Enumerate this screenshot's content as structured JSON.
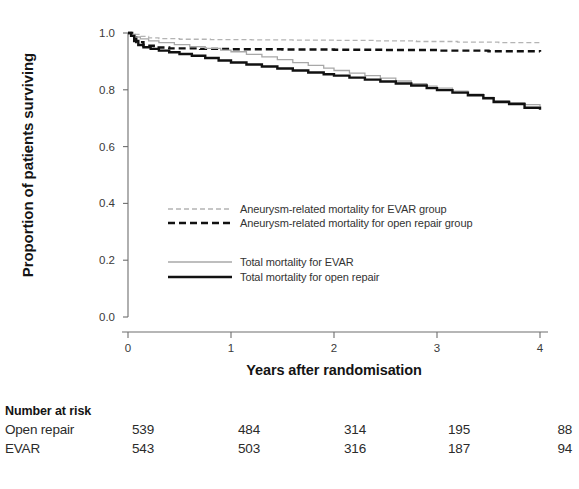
{
  "chart_data": {
    "type": "line",
    "title": "",
    "xlabel": "Years after randomisation",
    "ylabel": "Proportion of patients surviving",
    "xlim": [
      0,
      4
    ],
    "ylim": [
      0.0,
      1.0
    ],
    "xticks": [
      "0",
      "1",
      "2",
      "3",
      "4"
    ],
    "yticks": [
      "0.0",
      "0.2",
      "0.4",
      "0.6",
      "0.8",
      "1.0"
    ],
    "grid": false,
    "legend_position": "center-left",
    "series": [
      {
        "name": "Aneurysm-related mortality for EVAR group",
        "style": "dashed-thin",
        "color": "#b4b4b4",
        "x": [
          0,
          0.05,
          0.12,
          0.2,
          0.3,
          0.5,
          0.8,
          1.2,
          1.6,
          2.0,
          2.4,
          2.8,
          3.2,
          3.6,
          4.0
        ],
        "y": [
          1.0,
          0.995,
          0.988,
          0.983,
          0.98,
          0.978,
          0.977,
          0.976,
          0.975,
          0.974,
          0.972,
          0.97,
          0.968,
          0.966,
          0.965
        ]
      },
      {
        "name": "Aneurysm-related mortality for open repair group",
        "style": "dashed-thick",
        "color": "#111111",
        "x": [
          0,
          0.04,
          0.08,
          0.15,
          0.25,
          0.4,
          0.7,
          1.0,
          1.5,
          2.0,
          2.5,
          3.0,
          3.5,
          4.0
        ],
        "y": [
          1.0,
          0.985,
          0.968,
          0.955,
          0.949,
          0.946,
          0.944,
          0.943,
          0.942,
          0.941,
          0.94,
          0.938,
          0.936,
          0.934
        ]
      },
      {
        "name": "Total mortality for EVAR",
        "style": "solid-thin",
        "color": "#a8a8a8",
        "x": [
          0,
          0.03,
          0.07,
          0.12,
          0.2,
          0.3,
          0.45,
          0.6,
          0.75,
          0.9,
          1.0,
          1.15,
          1.3,
          1.45,
          1.6,
          1.75,
          1.9,
          2.0,
          2.15,
          2.3,
          2.45,
          2.6,
          2.75,
          2.9,
          3.0,
          3.15,
          3.3,
          3.45,
          3.55,
          3.7,
          3.85,
          4.0
        ],
        "y": [
          1.0,
          0.995,
          0.986,
          0.979,
          0.972,
          0.966,
          0.959,
          0.952,
          0.946,
          0.94,
          0.934,
          0.925,
          0.916,
          0.906,
          0.896,
          0.886,
          0.876,
          0.868,
          0.859,
          0.85,
          0.841,
          0.831,
          0.822,
          0.813,
          0.806,
          0.795,
          0.785,
          0.773,
          0.762,
          0.755,
          0.748,
          0.742
        ]
      },
      {
        "name": "Total mortality for open repair",
        "style": "solid-thick",
        "color": "#111111",
        "x": [
          0,
          0.03,
          0.06,
          0.1,
          0.15,
          0.22,
          0.3,
          0.4,
          0.5,
          0.62,
          0.75,
          0.88,
          1.0,
          1.15,
          1.3,
          1.45,
          1.6,
          1.75,
          1.9,
          2.0,
          2.15,
          2.3,
          2.45,
          2.6,
          2.75,
          2.9,
          3.0,
          3.15,
          3.3,
          3.45,
          3.55,
          3.7,
          3.85,
          4.0
        ],
        "y": [
          1.0,
          0.99,
          0.972,
          0.958,
          0.95,
          0.944,
          0.938,
          0.932,
          0.926,
          0.92,
          0.912,
          0.903,
          0.896,
          0.889,
          0.882,
          0.875,
          0.868,
          0.861,
          0.855,
          0.85,
          0.843,
          0.836,
          0.829,
          0.822,
          0.815,
          0.806,
          0.799,
          0.79,
          0.781,
          0.77,
          0.757,
          0.75,
          0.737,
          0.73
        ]
      }
    ]
  },
  "legend": {
    "entries": [
      {
        "label": "Aneurysm-related mortality for EVAR group",
        "style": "dashed-thin",
        "color": "#b4b4b4"
      },
      {
        "label": "Aneurysm-related mortality for open repair group",
        "style": "dashed-thick",
        "color": "#111111"
      },
      {
        "label": "Total mortality for EVAR",
        "style": "solid-thin",
        "color": "#a8a8a8"
      },
      {
        "label": "Total mortality for open repair",
        "style": "solid-thick",
        "color": "#111111"
      }
    ]
  },
  "risk_table": {
    "title": "Number at risk",
    "columns": [
      "0",
      "1",
      "2",
      "3",
      "4"
    ],
    "rows": [
      {
        "label": "Open repair",
        "values": [
          "539",
          "484",
          "314",
          "195",
          "88"
        ]
      },
      {
        "label": "EVAR",
        "values": [
          "543",
          "503",
          "316",
          "187",
          "94"
        ]
      }
    ]
  }
}
